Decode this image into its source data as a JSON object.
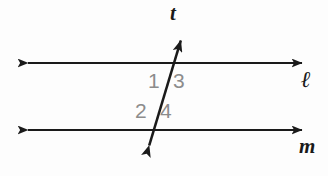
{
  "figure": {
    "background_color": "#fdfdfd",
    "stroke_color": "#1a1a1a",
    "angle_label_color": "#8c8c8c"
  },
  "lines": {
    "transversal": {
      "name": "t",
      "label": "t",
      "type": "double-arrow-line",
      "x1": 146,
      "y1": 156,
      "x2": 184,
      "y2": 30
    },
    "upper_parallel": {
      "name": "ell",
      "label": "ℓ",
      "type": "double-arrow-line",
      "x1": 18,
      "y1": 63,
      "x2": 312,
      "y2": 63
    },
    "lower_parallel": {
      "name": "m",
      "label": "m",
      "type": "double-arrow-line",
      "x1": 18,
      "y1": 130,
      "x2": 312,
      "y2": 130
    }
  },
  "intersections": {
    "upper": {
      "x": 172,
      "y": 63
    },
    "lower": {
      "x": 157,
      "y": 130
    }
  },
  "angles": [
    {
      "id": "1",
      "label": "1",
      "position": "upper-left",
      "x": 152,
      "y": 80
    },
    {
      "id": "3",
      "label": "3",
      "position": "upper-right",
      "x": 178,
      "y": 80
    },
    {
      "id": "2",
      "label": "2",
      "position": "lower-left",
      "x": 140,
      "y": 110
    },
    {
      "id": "4",
      "label": "4",
      "position": "lower-right",
      "x": 166,
      "y": 110
    }
  ]
}
